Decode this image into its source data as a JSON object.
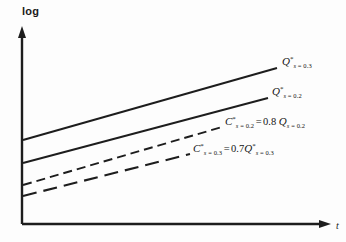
{
  "figure": {
    "background_color": "#fdfdfd",
    "ink_color": "#1d1d1d"
  },
  "axes": {
    "y_label": "log",
    "x_label": "t",
    "origin": [
      22,
      224
    ],
    "y_top": [
      22,
      28
    ],
    "x_right": [
      330,
      224
    ],
    "grid": false,
    "ticks": false
  },
  "labels": {
    "q_s03": {
      "symbol": "Q",
      "star": "*",
      "sub_var": "s",
      "sub_eq": " = ",
      "sub_val": "0.3"
    },
    "q_s02": {
      "symbol": "Q",
      "star": "*",
      "sub_var": "s",
      "sub_eq": " = ",
      "sub_val": "0.2"
    },
    "c_s02": {
      "symbol": "C",
      "star": "*",
      "sub_var": "s",
      "sub_eq": " = ",
      "sub_val": "0.2",
      "equals": "=",
      "coefficient": "0.8",
      "rhs_symbol": "Q",
      "rhs_star": "",
      "rhs_sub_var": "s",
      "rhs_sub_eq": " = ",
      "rhs_sub_val": "0.2"
    },
    "c_s03": {
      "symbol": "C",
      "star": "*",
      "sub_var": "s",
      "sub_eq": " = ",
      "sub_val": "0.3",
      "equals": "=",
      "coefficient": "0.7",
      "rhs_symbol": "Q",
      "rhs_star": "*",
      "rhs_sub_var": "s",
      "rhs_sub_eq": " = ",
      "rhs_sub_val": "0.3"
    }
  },
  "chart_data": {
    "type": "line",
    "title": "",
    "xlabel": "t",
    "ylabel": "log",
    "xlim": [
      0,
      1
    ],
    "ylim": [
      0,
      1
    ],
    "grid": false,
    "legend": "inline-end-labels",
    "note": "Four straight lines on a log (y) vs t (x) plot. Coordinates are in screenshot pixel space: x right, y down. Two solid upper lines are Q* curves; two dashed lower lines are C* curves at 0.8 and 0.7 of the corresponding Q*.",
    "series": [
      {
        "name": "Q*_s=0.3",
        "style": "solid",
        "color": "#1d1d1d",
        "width": 1.9,
        "label_key": "q_s03",
        "points": [
          [
            23,
            140
          ],
          [
            277,
            68
          ]
        ]
      },
      {
        "name": "Q*_s=0.2",
        "style": "solid",
        "color": "#1d1d1d",
        "width": 1.9,
        "label_key": "q_s02",
        "points": [
          [
            23,
            163
          ],
          [
            268,
            98
          ]
        ]
      },
      {
        "name": "C*_s=0.2 = 0.8 Q_s=0.2",
        "style": "dashed",
        "dash": "9 5",
        "color": "#1d1d1d",
        "width": 1.9,
        "label_key": "c_s02",
        "points": [
          [
            23,
            185
          ],
          [
            222,
            127
          ]
        ]
      },
      {
        "name": "C*_s=0.3 = 0.7 Q*_s=0.3",
        "style": "dashed",
        "dash": "14 7",
        "color": "#1d1d1d",
        "width": 2.1,
        "label_key": "c_s03",
        "points": [
          [
            23,
            196
          ],
          [
            190,
            154
          ]
        ]
      }
    ]
  }
}
